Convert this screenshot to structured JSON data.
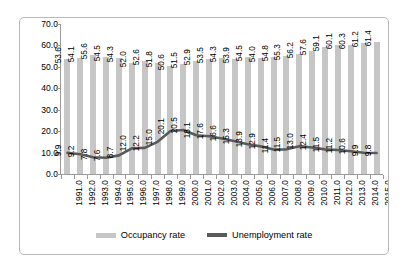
{
  "chart_data": {
    "type": "bar",
    "title": "",
    "subtitle": "",
    "xlabel": "",
    "ylabel": "",
    "ylim": [
      0,
      70
    ],
    "ytick_labels": [
      "70.0",
      "60.0",
      "50.0",
      "40.0",
      "30.0",
      "20.0",
      "10.0",
      "0.0"
    ],
    "ytick_values": [
      70,
      60,
      50,
      40,
      30,
      20,
      10,
      0
    ],
    "grid": false,
    "legend_position": "bottom-center",
    "categories": [
      "1991.0",
      "1992.0",
      "1993.0",
      "1994.0",
      "1995.0",
      "1996.0",
      "1997.0",
      "1998.0",
      "1999.0",
      "2000.0",
      "2001.0",
      "2002.0",
      "2003.0",
      "2004.0",
      "2005.0",
      "2006.0",
      "2007.0",
      "2008.0",
      "2009.0",
      "2010.0",
      "2011.0",
      "2012.0",
      "2013.0",
      "2014.0",
      "2015.0"
    ],
    "series": [
      {
        "name": "Occupancy rate",
        "render": "bar",
        "color": "#c6c6c6",
        "values": [
          53.6,
          54.1,
          55.6,
          54.5,
          54.3,
          52.0,
          52.6,
          51.8,
          50.6,
          51.5,
          52.9,
          53.5,
          54.3,
          53.9,
          54.5,
          54.0,
          54.8,
          55.3,
          56.2,
          57.6,
          59.1,
          60.1,
          60.3,
          61.2,
          61.4
        ],
        "labels": [
          "53.6",
          "54.1",
          "55.6",
          "54.5",
          "54.3",
          "52.0",
          "52.6",
          "51.8",
          "50.6",
          "51.5",
          "52.9",
          "53.5",
          "54.3",
          "53.9",
          "54.5",
          "54.0",
          "54.8",
          "55.3",
          "56.2",
          "57.6",
          "59.1",
          "60.1",
          "60.3",
          "61.2",
          "61.4"
        ]
      },
      {
        "name": "Unemployment rate",
        "render": "line",
        "color": "#5a5a5a",
        "values": [
          9.9,
          9.2,
          7.8,
          7.6,
          8.7,
          12.0,
          12.2,
          15.0,
          20.1,
          20.5,
          18.1,
          17.6,
          16.6,
          15.3,
          13.9,
          12.9,
          11.4,
          11.5,
          13.0,
          12.4,
          11.5,
          11.2,
          10.6,
          9.9,
          9.8
        ],
        "labels": [
          "9.9",
          "9.2",
          "7.8",
          "7.6",
          "8.7",
          "12.0",
          "12.2",
          "15.0",
          "20.1",
          "20.5",
          "18.1",
          "17.6",
          "16.6",
          "15.3",
          "13.9",
          "12.9",
          "11.4",
          "11.5",
          "13.0",
          "12.4",
          "11.5",
          "11.2",
          "10.6",
          "9.9",
          "9.8"
        ]
      }
    ]
  },
  "legend": {
    "entries": [
      {
        "label": "Occupancy rate",
        "icon": "bar-swatch-icon"
      },
      {
        "label": "Unemployment rate",
        "icon": "line-swatch-icon"
      }
    ]
  }
}
